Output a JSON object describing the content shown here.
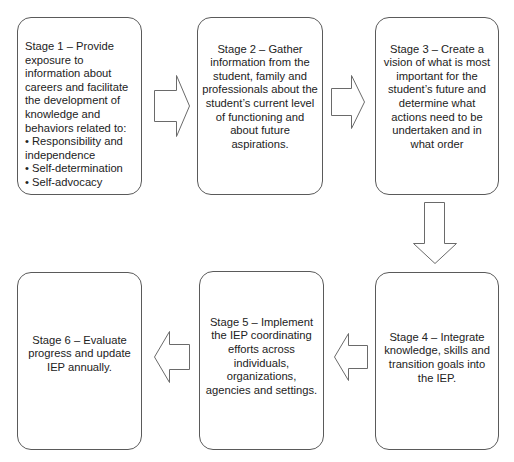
{
  "diagram": {
    "type": "process-flow",
    "colors": {
      "box_border": "#5a5a5a",
      "arrow_stroke": "#6a6a6a",
      "background": "#ffffff",
      "text": "#222222"
    },
    "stages": [
      {
        "id": 1,
        "title": "Stage 1 – Provide exposure to information about careers and facilitate the development of knowledge and behaviors related to:",
        "bullets": [
          "Responsibility and independence",
          "Self-determination",
          "Self-advocacy"
        ]
      },
      {
        "id": 2,
        "title": "Stage 2 – Gather information from the student, family and professionals about the student’s current level of functioning and about future aspirations."
      },
      {
        "id": 3,
        "title": "Stage 3 – Create a vision of what is most important for the student’s future and determine what actions need to be undertaken and in what order"
      },
      {
        "id": 4,
        "title": "Stage 4 – Integrate knowledge, skills and transition goals into the IEP."
      },
      {
        "id": 5,
        "title": "Stage 5 – Implement the IEP coordinating efforts across individuals, organizations, agencies and settings."
      },
      {
        "id": 6,
        "title": "Stage 6 – Evaluate progress and update IEP annually."
      }
    ],
    "arrows": [
      {
        "from": 1,
        "to": 2,
        "direction": "right"
      },
      {
        "from": 2,
        "to": 3,
        "direction": "right"
      },
      {
        "from": 3,
        "to": 4,
        "direction": "down"
      },
      {
        "from": 4,
        "to": 5,
        "direction": "left"
      },
      {
        "from": 5,
        "to": 6,
        "direction": "left"
      }
    ]
  }
}
